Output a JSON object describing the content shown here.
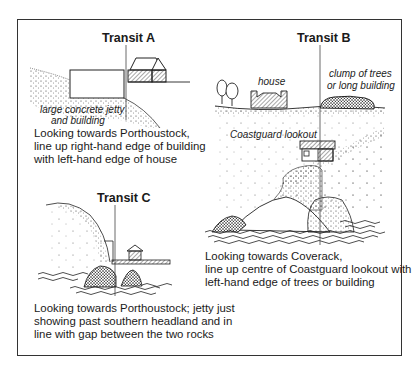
{
  "figure": {
    "panels": [
      {
        "id": "transit-a",
        "title": "Transit A",
        "labels": [
          "large concrete jetty",
          "and building"
        ],
        "caption_lines": [
          "Looking towards Porthoustock,",
          "line up right-hand edge of building",
          "with left-hand edge of house"
        ]
      },
      {
        "id": "transit-b",
        "title": "Transit B",
        "labels": {
          "house": "house",
          "trees_line1": "clump of trees",
          "trees_line2": "or long building",
          "lookout": "Coastguard lookout"
        },
        "caption_lines": [
          "Looking towards Coverack,",
          "line up centre of Coastguard lookout with",
          "left-hand edge of trees or building"
        ]
      },
      {
        "id": "transit-c",
        "title": "Transit C",
        "caption_lines": [
          "Looking towards Porthoustock; jetty just",
          "showing past southern headland and in",
          "line with gap between the two rocks"
        ]
      }
    ],
    "colors": {
      "ink": "#1a1a1a",
      "frame": "#333333",
      "background": "#ffffff"
    }
  }
}
